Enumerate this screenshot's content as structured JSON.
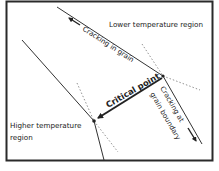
{
  "diagram": {
    "labels": {
      "lower_region": "Lower temperature region",
      "higher_region_line1": "Higher temperature",
      "higher_region_line2": "region",
      "cracking_in_grain": "Cracking in grain",
      "critical_point": "Critical point",
      "cracking_boundary_line1": "Cracking at",
      "cracking_boundary_line2": "grain boundary"
    },
    "colors": {
      "line": "#333333",
      "frame": "#2a2a2a",
      "dotted": "#777777",
      "text": "#222222"
    }
  }
}
